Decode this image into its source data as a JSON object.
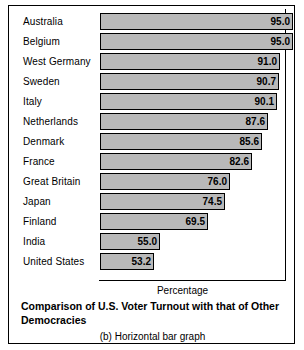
{
  "chart_data": {
    "type": "bar",
    "orientation": "horizontal",
    "title": "Comparison of U.S. Voter Turnout with that of Other Democracies",
    "subtitle": "(b) Horizontal bar graph",
    "xlabel": "Percentage",
    "ylabel": "",
    "grid": false,
    "legend": null,
    "xlim": [
      37,
      95
    ],
    "categories": [
      "Australia",
      "Belgium",
      "West Germany",
      "Sweden",
      "Italy",
      "Netherlands",
      "Denmark",
      "France",
      "Great Britain",
      "Japan",
      "Finland",
      "India",
      "United States"
    ],
    "values": [
      95.0,
      95.0,
      91.0,
      90.7,
      90.1,
      87.6,
      85.6,
      82.6,
      76.0,
      74.5,
      69.5,
      55.0,
      53.2
    ],
    "value_labels": [
      "95.0",
      "95.0",
      "91.0",
      "90.7",
      "90.1",
      "87.6",
      "85.6",
      "82.6",
      "76.0",
      "74.5",
      "69.5",
      "55.0",
      "53.2"
    ],
    "bar_color": "#b9b9b9",
    "bar_border_color": "#000000"
  },
  "figure": {
    "axis_title": "Percentage",
    "caption": "Comparison of U.S. Voter Turnout with that of Other Democracies",
    "sub_caption": "(b) Horizontal bar graph"
  }
}
